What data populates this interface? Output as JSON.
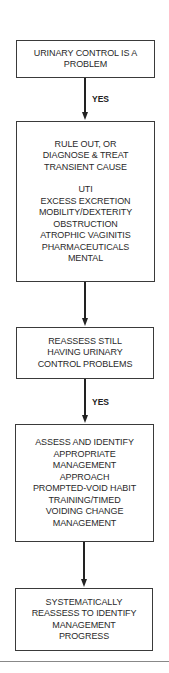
{
  "flowchart": {
    "nodes": [
      {
        "id": "box1",
        "lines": [
          "URINARY CONTROL IS A",
          "PROBLEM"
        ]
      },
      {
        "id": "box2",
        "lines": [
          "RULE OUT, OR",
          "DIAGNOSE & TREAT",
          "TRANSIENT CAUSE"
        ],
        "sublines": [
          "UTI",
          "EXCESS EXCRETION",
          "MOBILITY/DEXTERITY",
          "OBSTRUCTION",
          "ATROPHIC VAGINITIS",
          "PHARMACEUTICALS",
          "MENTAL"
        ]
      },
      {
        "id": "box3",
        "lines": [
          "REASSESS STILL",
          "HAVING URINARY",
          "CONTROL PROBLEMS"
        ]
      },
      {
        "id": "box4",
        "lines": [
          "ASSESS AND IDENTIFY",
          "APPROPRIATE",
          "MANAGEMENT",
          "APPROACH",
          "PROMPTED-VOID HABIT",
          "TRAINING/TIMED",
          "VOIDING CHANGE",
          "MANAGEMENT"
        ]
      },
      {
        "id": "box5",
        "lines": [
          "SYSTEMATICALLY",
          "REASSESS TO IDENTIFY",
          "MANAGEMENT",
          "PROGRESS"
        ]
      }
    ],
    "edges": [
      {
        "from": "box1",
        "to": "box2",
        "label": "YES"
      },
      {
        "from": "box2",
        "to": "box3",
        "label": ""
      },
      {
        "from": "box3",
        "to": "box4",
        "label": "YES"
      },
      {
        "from": "box4",
        "to": "box5",
        "label": ""
      }
    ]
  }
}
